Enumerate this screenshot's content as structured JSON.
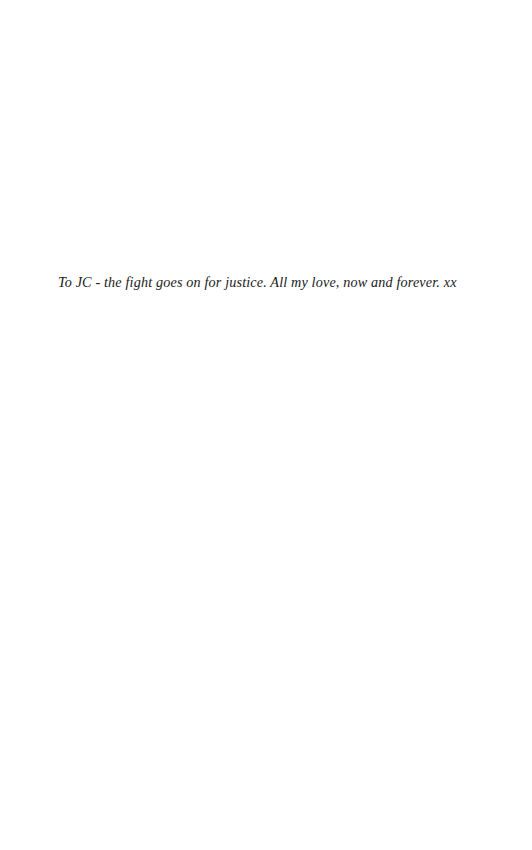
{
  "page": {
    "kind": "book-dedication-page",
    "width": 532,
    "height": 850,
    "background_color": "#ffffff"
  },
  "dedication": {
    "text": "To JC - the fight goes on for justice. All my love, now and forever. xx",
    "text_color": "#1a1a1a",
    "style": "italic-serif"
  }
}
